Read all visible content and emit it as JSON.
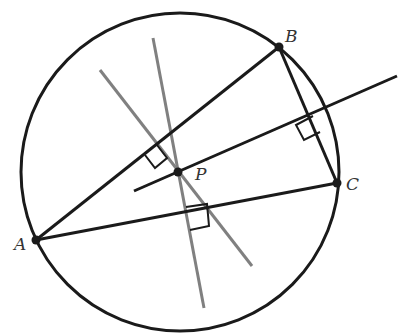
{
  "diagram": {
    "type": "geometry",
    "colors": {
      "background": "#ffffff",
      "stroke_primary": "#1a1a1a",
      "stroke_bisector_gray": "#808080",
      "label": "#333333"
    },
    "circle": {
      "cx": 180,
      "cy": 172,
      "r": 159
    },
    "points": [
      {
        "id": "A",
        "label": "A",
        "x": 36,
        "y": 240,
        "label_x": 14,
        "label_y": 250
      },
      {
        "id": "B",
        "label": "B",
        "x": 279,
        "y": 47,
        "label_x": 285,
        "label_y": 42
      },
      {
        "id": "C",
        "label": "C",
        "x": 337,
        "y": 183,
        "label_x": 346,
        "label_y": 190
      },
      {
        "id": "P",
        "label": "P",
        "x": 178,
        "y": 172,
        "label_x": 195,
        "label_y": 180
      }
    ],
    "triangle_sides": [
      {
        "name": "AB",
        "x1": 36,
        "y1": 240,
        "x2": 279,
        "y2": 47
      },
      {
        "name": "AC",
        "x1": 36,
        "y1": 240,
        "x2": 337,
        "y2": 183
      },
      {
        "name": "BC",
        "x1": 279,
        "y1": 47,
        "x2": 337,
        "y2": 183
      }
    ],
    "bisectors": [
      {
        "name": "perp-bisector-BC",
        "color": "black",
        "x1": 134,
        "y1": 191,
        "x2": 397,
        "y2": 76
      },
      {
        "name": "perp-bisector-AB",
        "color": "gray",
        "x1": 100,
        "y1": 70,
        "x2": 252,
        "y2": 266
      },
      {
        "name": "perp-bisector-AC",
        "color": "gray",
        "x1": 153,
        "y1": 38,
        "x2": 204,
        "y2": 308
      }
    ],
    "right_angle_marks": [
      {
        "name": "right-angle-AB",
        "points": "157,145 167,158 155,168 145,155"
      },
      {
        "name": "right-angle-AC",
        "points": "186,207 207,204 209,226 190,230"
      },
      {
        "name": "right-angle-BC",
        "points": "313,116 296,125 304,140 320,132"
      }
    ]
  }
}
